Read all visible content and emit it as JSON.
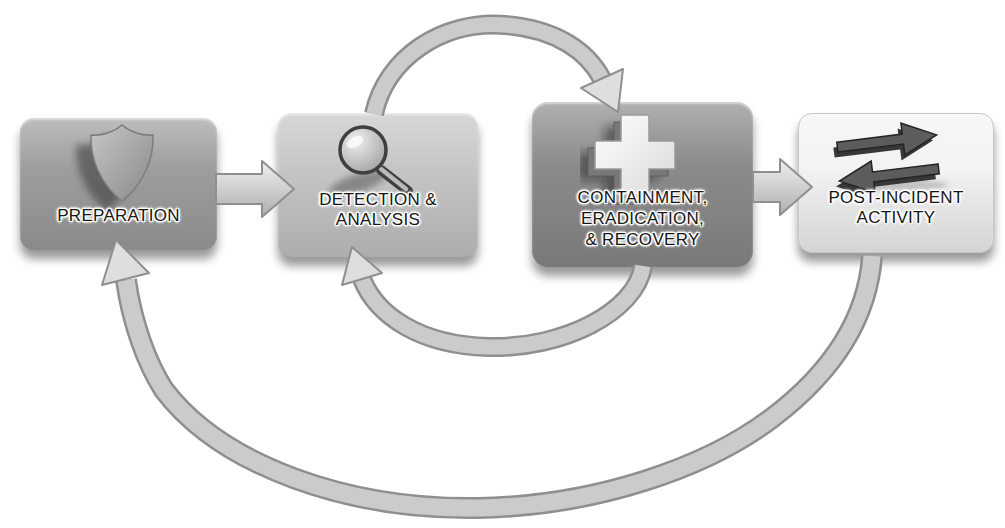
{
  "palette": {
    "page-bg": "#ffffff",
    "box-preparation": "#9e9e9e",
    "box-detection": "#c6c6c6",
    "box-containment": "#8b8b8b",
    "box-post-incident": "#f3f3f3",
    "label-color": "#161616",
    "arrow-fill": "#cbcbcb",
    "arrow-outline": "#8f8f8f",
    "arrow-head-fill": "#dedede"
  },
  "stages": [
    {
      "id": "preparation",
      "icon": "shield-icon",
      "lines": [
        "PREPARATION"
      ]
    },
    {
      "id": "detection-analysis",
      "icon": "magnifying-glass-icon",
      "lines": [
        "DETECTION &",
        "ANALYSIS"
      ]
    },
    {
      "id": "containment-eradication-recovery",
      "icon": "medical-cross-icon",
      "lines": [
        "CONTAINMENT,",
        "ERADICATION,",
        "& RECOVERY"
      ]
    },
    {
      "id": "post-incident-activity",
      "icon": "swap-arrows-icon",
      "lines": [
        "POST-INCIDENT",
        "ACTIVITY"
      ]
    }
  ],
  "connections": [
    {
      "from": "preparation",
      "to": "detection-analysis",
      "style": "straight-block-arrow"
    },
    {
      "from": "detection-analysis",
      "to": "containment-eradication-recovery",
      "style": "curved-arrow-over-top"
    },
    {
      "from": "containment-eradication-recovery",
      "to": "detection-analysis",
      "style": "curved-arrow-under-bottom"
    },
    {
      "from": "containment-eradication-recovery",
      "to": "post-incident-activity",
      "style": "straight-block-arrow"
    },
    {
      "from": "post-incident-activity",
      "to": "preparation",
      "style": "large-return-loop-bottom"
    }
  ]
}
